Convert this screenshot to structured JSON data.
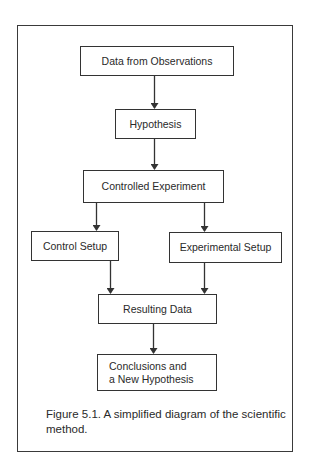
{
  "diagram": {
    "type": "flowchart",
    "nodes": [
      {
        "id": "observations",
        "label": "Data from Observations"
      },
      {
        "id": "hypothesis",
        "label": "Hypothesis"
      },
      {
        "id": "experiment",
        "label": "Controlled Experiment"
      },
      {
        "id": "control",
        "label": "Control Setup"
      },
      {
        "id": "experimental",
        "label": "Experimental Setup"
      },
      {
        "id": "results",
        "label": "Resulting Data"
      },
      {
        "id": "conclusions",
        "label": "Conclusions and\na New Hypothesis"
      }
    ],
    "edges": [
      {
        "from": "observations",
        "to": "hypothesis"
      },
      {
        "from": "hypothesis",
        "to": "experiment"
      },
      {
        "from": "experiment",
        "to": "control"
      },
      {
        "from": "experiment",
        "to": "experimental"
      },
      {
        "from": "control",
        "to": "results"
      },
      {
        "from": "experimental",
        "to": "results"
      },
      {
        "from": "results",
        "to": "conclusions"
      }
    ],
    "caption": "Figure 5.1. A simplified diagram of the scientific method."
  },
  "colors": {
    "line": "#333333",
    "text": "#2a2a2a",
    "background": "#ffffff"
  }
}
